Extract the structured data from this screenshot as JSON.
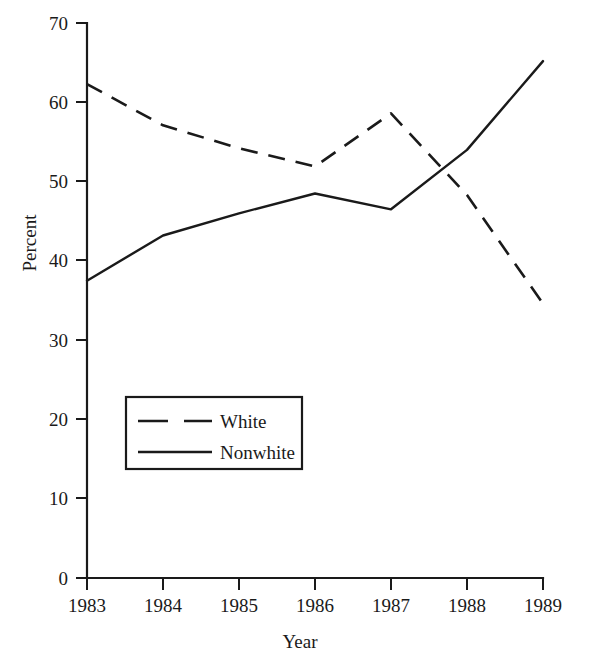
{
  "chart_data": {
    "type": "line",
    "title": "",
    "xlabel": "Year",
    "ylabel": "Percent",
    "x": [
      1983,
      1984,
      1985,
      1986,
      1987,
      1988,
      1989
    ],
    "xtick_labels": [
      "1983",
      "1984",
      "1985",
      "1986",
      "1987",
      "1988",
      "1989"
    ],
    "ytick_labels": [
      "0",
      "10",
      "20",
      "30",
      "40",
      "50",
      "60",
      "70"
    ],
    "ytick_values": [
      0,
      10,
      20,
      30,
      40,
      50,
      60,
      70
    ],
    "ylim": [
      0,
      70
    ],
    "xlim": [
      1983,
      1989
    ],
    "grid": false,
    "legend_position": "lower-left-inside",
    "series": [
      {
        "name": "White",
        "style": "dashed",
        "color": "#1a1a1a",
        "values": [
          62.3,
          57.1,
          54.2,
          51.9,
          58.6,
          48.3,
          34.6
        ]
      },
      {
        "name": "Nonwhite",
        "style": "solid",
        "color": "#1a1a1a",
        "values": [
          37.5,
          43.2,
          46.0,
          48.5,
          46.5,
          54.0,
          65.2
        ]
      }
    ]
  },
  "legend": {
    "items": [
      {
        "label": "White",
        "style": "dashed"
      },
      {
        "label": "Nonwhite",
        "style": "solid"
      }
    ]
  },
  "colors": {
    "ink": "#1a1a1a",
    "background": "#ffffff"
  }
}
